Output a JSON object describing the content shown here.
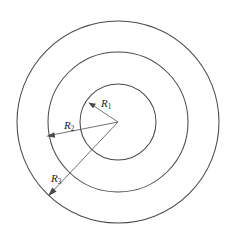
{
  "diagram": {
    "type": "geometry-diagram",
    "background_color": "#ffffff",
    "stroke_color": "#4a4a4a",
    "label_color": "#1c1c1c",
    "center": {
      "x": 118,
      "y": 122
    },
    "circles": [
      {
        "name": "inner-circle",
        "radius": 38,
        "label": "R",
        "subscript": "1"
      },
      {
        "name": "middle-circle",
        "radius": 70,
        "label": "R",
        "subscript": "2"
      },
      {
        "name": "outer-circle",
        "radius": 101,
        "label": "R",
        "subscript": "3"
      }
    ],
    "radius_arrows": [
      {
        "name": "radius-arrow-r1",
        "label": "R",
        "subscript": "1",
        "from": {
          "x": 118,
          "y": 122
        },
        "to": {
          "x": 89,
          "y": 103
        },
        "label_pos": {
          "x": 101,
          "y": 104
        }
      },
      {
        "name": "radius-arrow-r2",
        "label": "R",
        "subscript": "2",
        "from": {
          "x": 118,
          "y": 122
        },
        "to": {
          "x": 47,
          "y": 136
        },
        "label_pos": {
          "x": 66,
          "y": 126
        }
      },
      {
        "name": "radius-arrow-r3",
        "label": "R",
        "subscript": "3",
        "from": {
          "x": 118,
          "y": 122
        },
        "to": {
          "x": 48,
          "y": 196
        },
        "label_pos": {
          "x": 54,
          "y": 178
        }
      }
    ]
  },
  "labels": {
    "r1": "R",
    "r1_sub": "1",
    "r2": "R",
    "r2_sub": "2",
    "r3": "R",
    "r3_sub": "3"
  }
}
